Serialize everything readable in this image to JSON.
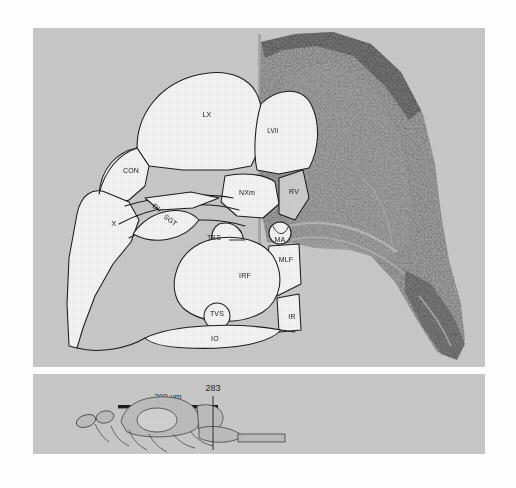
{
  "figure": {
    "panels": {
      "main": {
        "name": "main-section-panel"
      },
      "inset": {
        "name": "level-inset-panel"
      }
    }
  },
  "main_panel": {
    "labels": [
      {
        "id": "LX",
        "text": "LX",
        "x": 174,
        "y": 89,
        "rotate": 0,
        "anchor": "middle"
      },
      {
        "id": "LVII",
        "text": "LVII",
        "x": 240,
        "y": 105,
        "rotate": 0,
        "anchor": "middle"
      },
      {
        "id": "CON",
        "text": "CON",
        "x": 98,
        "y": 145,
        "rotate": 0,
        "anchor": "middle"
      },
      {
        "id": "NXm",
        "text": "NXm",
        "x": 214,
        "y": 167,
        "rotate": 0,
        "anchor": "middle"
      },
      {
        "id": "RV",
        "text": "RV",
        "x": 261,
        "y": 166,
        "rotate": 0,
        "anchor": "middle"
      },
      {
        "id": "X",
        "text": "X",
        "x": 81,
        "y": 198,
        "rotate": 0,
        "anchor": "middle"
      },
      {
        "id": "DV",
        "text": "DV",
        "x": 123,
        "y": 182,
        "rotate": 38,
        "anchor": "middle"
      },
      {
        "id": "SGT",
        "text": "SGT",
        "x": 136,
        "y": 194,
        "rotate": 38,
        "anchor": "middle"
      },
      {
        "id": "TBS",
        "text": "TBS",
        "x": 181,
        "y": 212,
        "rotate": 0,
        "anchor": "middle"
      },
      {
        "id": "MA",
        "text": "MA",
        "x": 247,
        "y": 214,
        "rotate": 0,
        "anchor": "middle"
      },
      {
        "id": "MLF",
        "text": "MLF",
        "x": 253,
        "y": 234,
        "rotate": 0,
        "anchor": "middle"
      },
      {
        "id": "IRF",
        "text": "IRF",
        "x": 212,
        "y": 250,
        "rotate": 0,
        "anchor": "middle"
      },
      {
        "id": "TVS",
        "text": "TVS",
        "x": 184,
        "y": 288,
        "rotate": 0,
        "anchor": "middle"
      },
      {
        "id": "IR",
        "text": "IR",
        "x": 259,
        "y": 291,
        "rotate": 0,
        "anchor": "middle"
      },
      {
        "id": "IO",
        "text": "IO",
        "x": 182,
        "y": 313,
        "rotate": 0,
        "anchor": "middle"
      }
    ]
  },
  "inset_panel": {
    "scale_bar": {
      "label": "200 µm"
    },
    "section_number": "283"
  },
  "colors": {
    "panel_background": "#c9c9c9",
    "page_background": "#fefefe",
    "outline": "#1d1d1d",
    "schematic_fill": "#f2f2f2",
    "tissue_dark": "#6d6d6d",
    "tissue_mid": "#8f8f8f",
    "label_text": "#1a1a1a"
  }
}
